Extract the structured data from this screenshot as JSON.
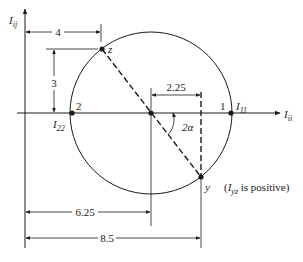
{
  "figure": {
    "type": "mohr-circle",
    "axes": {
      "horizontal": {
        "label": "I",
        "subscript": "ii"
      },
      "vertical": {
        "label": "I",
        "subscript": "ij"
      }
    },
    "points": {
      "z": {
        "label": "z"
      },
      "y": {
        "label": "y"
      },
      "p1": {
        "label": "1",
        "name": "I",
        "subscript": "11"
      },
      "p2": {
        "label": "2",
        "name": "I",
        "subscript": "22"
      }
    },
    "angle_label": "2α",
    "dimensions": {
      "horizontal_to_z": "4",
      "vertical_z": "3",
      "center_to_y": "2.25",
      "origin_to_center": "6.25",
      "origin_to_y": "8.5"
    },
    "note": {
      "prefix": "(",
      "var": "I",
      "var_subscript": "yz",
      "suffix": " is positive)"
    }
  }
}
